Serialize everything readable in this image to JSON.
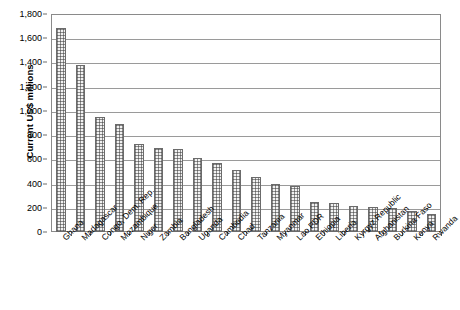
{
  "chart_data": {
    "type": "bar",
    "title": "",
    "xlabel": "",
    "ylabel": "Current US$ millions",
    "ylim": [
      0,
      1800
    ],
    "ytick_step": 200,
    "yticks": [
      "1,800",
      "1,600",
      "1,400",
      "1,200",
      "1,000",
      "800",
      "600",
      "400",
      "200",
      "0"
    ],
    "grid": true,
    "legend": "none",
    "bar_fill": "crosshatch-light-gray",
    "bar_edge_color": "#6b6b6b",
    "categories": [
      "Ghana",
      "Madagascar",
      "Congo, Dem. Rep.",
      "Mozambique",
      "Niger",
      "Zambia",
      "Bangladesh",
      "Uganda",
      "Cambodia",
      "Chad",
      "Tanzania",
      "Myanmar",
      "Lao PDR",
      "Ethiopia",
      "Liberia",
      "Kyrgyz Republic",
      "Afghanistan",
      "Burkina Faso",
      "Kenya",
      "Rwanda"
    ],
    "values": [
      1685,
      1380,
      950,
      890,
      730,
      695,
      685,
      610,
      570,
      510,
      455,
      395,
      380,
      250,
      240,
      215,
      205,
      198,
      175,
      150
    ]
  }
}
